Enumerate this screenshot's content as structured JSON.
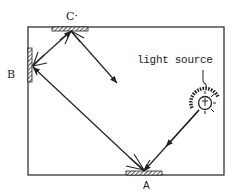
{
  "diagram": {
    "type": "light reflection with three mirrors in a box",
    "labels": {
      "mirror_a": "A",
      "mirror_b": "B",
      "mirror_c": "C·",
      "light_source": "light source"
    },
    "elements": [
      {
        "id": "box",
        "kind": "rectangle",
        "description": "enclosure"
      },
      {
        "id": "mirror_a",
        "kind": "mirror",
        "position": "bottom wall"
      },
      {
        "id": "mirror_b",
        "kind": "mirror",
        "position": "left wall"
      },
      {
        "id": "mirror_c",
        "kind": "mirror",
        "position": "top wall"
      },
      {
        "id": "light_source",
        "kind": "lamp",
        "position": "right side"
      }
    ],
    "ray_path": [
      "light source",
      "A",
      "B",
      "C",
      "out"
    ],
    "colors": {
      "ink": "#222222",
      "background": "#ffffff"
    }
  }
}
